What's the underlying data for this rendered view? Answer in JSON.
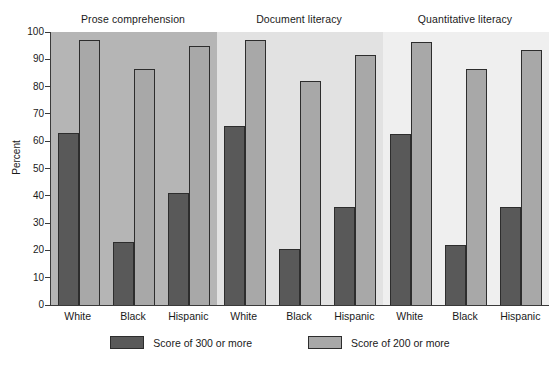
{
  "chart_data": {
    "type": "bar",
    "title": "",
    "subtitle": "",
    "xlabel": "",
    "ylabel": "Percent",
    "ylim": [
      0,
      100
    ],
    "yticks": [
      0,
      10,
      20,
      30,
      40,
      50,
      60,
      70,
      80,
      90,
      100
    ],
    "ytick_labels": [
      "0",
      "10",
      "20",
      "30",
      "40",
      "50",
      "60",
      "70",
      "80",
      "90",
      "100"
    ],
    "grid": false,
    "legend_position": "bottom",
    "categories": [
      "White",
      "Black",
      "Hispanic"
    ],
    "panels": [
      {
        "label": "Prose comprehension",
        "categories": [
          "White",
          "Black",
          "Hispanic"
        ],
        "series": [
          {
            "name": "Score of 300 or more",
            "values": [
              63,
              23,
              41
            ]
          },
          {
            "name": "Score of 200 or more",
            "values": [
              97,
              86.5,
              95
            ]
          }
        ]
      },
      {
        "label": "Document literacy",
        "categories": [
          "White",
          "Black",
          "Hispanic"
        ],
        "series": [
          {
            "name": "Score of 300 or more",
            "values": [
              65.5,
              20.5,
              36
            ]
          },
          {
            "name": "Score of 200 or more",
            "values": [
              97,
              82,
              91.5
            ]
          }
        ]
      },
      {
        "label": "Quantitative literacy",
        "categories": [
          "White",
          "Black",
          "Hispanic"
        ],
        "series": [
          {
            "name": "Score of 300 or more",
            "values": [
              62.5,
              22,
              36
            ]
          },
          {
            "name": "Score of 200 or more",
            "values": [
              96.5,
              86.5,
              93.5
            ]
          }
        ]
      }
    ],
    "series_colors": {
      "Score of 300 or more": "#595959",
      "Score of 200 or more": "#a8a8a8"
    },
    "panel_backgrounds": [
      "#b5b5b5",
      "#e2e2e2",
      "#efefef"
    ]
  },
  "legend": {
    "items": [
      {
        "label": "Score of 300 or more",
        "swatch": "dark"
      },
      {
        "label": "Score of 200 or more",
        "swatch": "light"
      }
    ]
  }
}
